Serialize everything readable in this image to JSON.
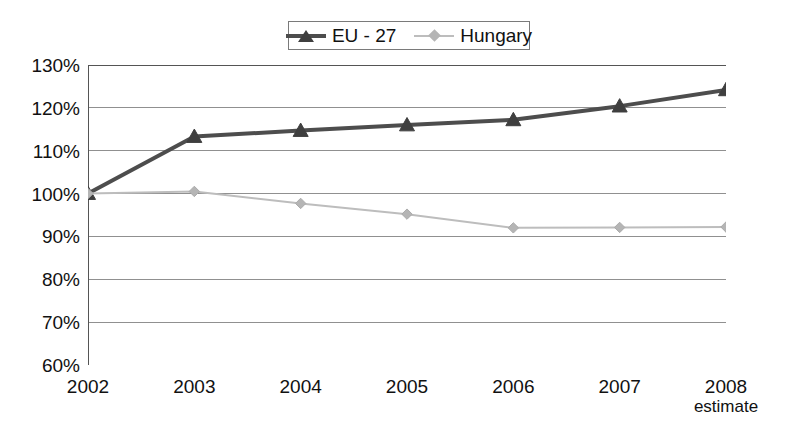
{
  "chart_data": {
    "type": "line",
    "title": "",
    "subtitle": "",
    "xlabel": "",
    "ylabel": "",
    "categories": [
      "2002",
      "2003",
      "2004",
      "2005",
      "2006",
      "2007",
      "2008"
    ],
    "x_tick_sublabels": [
      "",
      "",
      "",
      "",
      "",
      "",
      "estimate"
    ],
    "ylim": [
      60,
      130
    ],
    "y_ticks": [
      130,
      120,
      110,
      100,
      90,
      80,
      70,
      60
    ],
    "y_tick_labels": [
      "130%",
      "120%",
      "110%",
      "100%",
      "90%",
      "80%",
      "70%",
      "60%"
    ],
    "y_unit": "%",
    "grid": true,
    "grid_axis": "y",
    "legend_position": "top-center",
    "series": [
      {
        "name": "EU - 27",
        "color": "#4d4d4d",
        "marker": "triangle",
        "line_width": 4,
        "values": [
          100,
          113.3,
          114.7,
          116,
          117.2,
          120.4,
          124.2
        ]
      },
      {
        "name": "Hungary",
        "color": "#bdbdbd",
        "marker": "diamond",
        "line_width": 2,
        "values": [
          100,
          100.5,
          97.7,
          95.2,
          92,
          92.1,
          92.2
        ]
      }
    ]
  },
  "legend": {
    "entries": [
      {
        "label": "EU - 27"
      },
      {
        "label": "Hungary"
      }
    ]
  },
  "colors": {
    "eu_series": "#4d4d4d",
    "hungary_series": "#bdbdbd",
    "axis": "#555555",
    "gridline": "#909090",
    "background": "#ffffff",
    "text": "#111111"
  }
}
